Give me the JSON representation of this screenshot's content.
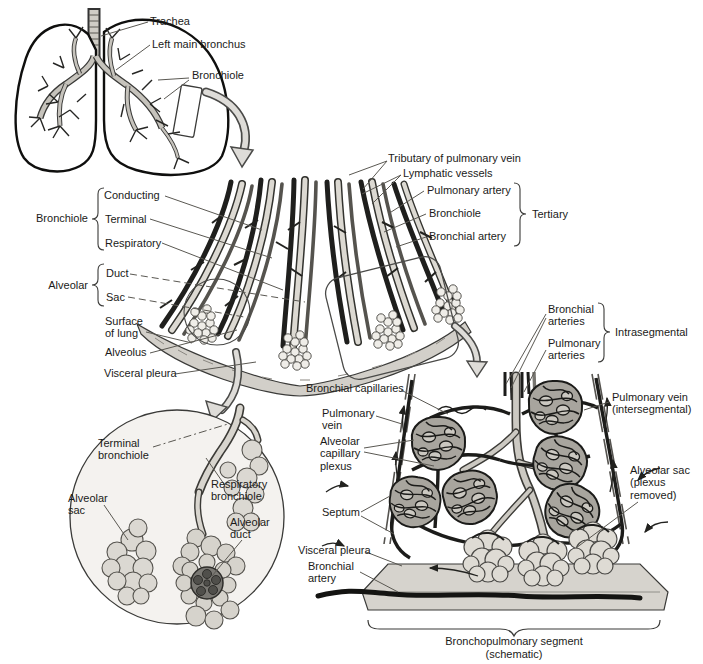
{
  "colors": {
    "paper": "#ffffff",
    "ink": "#1c1c1a",
    "tube_light": "#d8d5ce",
    "vessel_dark": "#1f1f1d",
    "fill_gray": "#d6d3cd"
  },
  "lungs": {
    "trachea": "Trachea",
    "left_main_bronchus": "Left main bronchus",
    "bronchiole": "Bronchiole"
  },
  "wedge": {
    "bronchiole_group": {
      "label": "Bronchiole",
      "items": [
        "Conducting",
        "Terminal",
        "Respiratory"
      ]
    },
    "alveolar_group": {
      "label": "Alveolar",
      "items": [
        "Duct",
        "Sac"
      ]
    },
    "surface_of_lung": "Surface of lung",
    "alveolus": "Alveolus",
    "visceral_pleura": "Visceral pleura",
    "tertiary_group": {
      "label": "Tertiary",
      "items": [
        "Tributary of pulmonary vein",
        "Lymphatic vessels",
        "Pulmonary artery",
        "Bronchiole",
        "Bronchial artery"
      ]
    }
  },
  "inset": {
    "terminal_bronchiole": "Terminal bronchiole",
    "alveolar_sac": "Alveolar sac",
    "respiratory_bronchiole": "Respiratory bronchiole",
    "alveolar_duct": "Alveolar duct"
  },
  "segment": {
    "intrasegmental_group": {
      "label": "Intrasegmental",
      "items": [
        "Bronchial arteries",
        "Pulmonary arteries"
      ]
    },
    "bronchial_capillaries": "Bronchial capillaries",
    "pulmonary_vein": "Pulmonary vein",
    "alveolar_capillary_plexus": "Alveolar capillary plexus",
    "pulmonary_vein_intersegmental": "Pulmonary vein (intersegmental)",
    "alveolar_sac_plexus_removed": "Alveolar sac (plexus removed)",
    "septum": "Septum",
    "visceral_pleura": "Visceral pleura",
    "bronchial_artery": "Bronchial artery",
    "caption_line1": "Bronchopulmonary segment",
    "caption_line2": "(schematic)"
  }
}
